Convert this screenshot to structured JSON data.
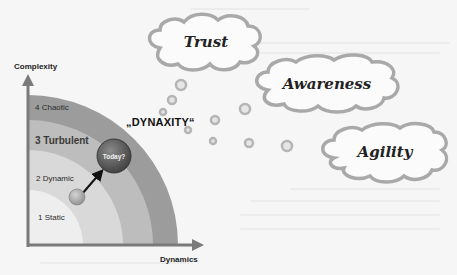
{
  "diagram": {
    "y_axis_label": "Complexity",
    "x_axis_label": "Dynamics",
    "title": "„DYNAXITY“",
    "zones": [
      {
        "label": "1 Static",
        "emphasis": false,
        "color": "#eeeeee"
      },
      {
        "label": "2 Dynamic",
        "emphasis": false,
        "color": "#d9d9d9"
      },
      {
        "label": "3 Turbulent",
        "emphasis": true,
        "color": "#bdbdbd"
      },
      {
        "label": "4 Chaotic",
        "emphasis": false,
        "color": "#9c9c9c"
      }
    ],
    "current_state": {
      "label": "Today?",
      "color": "#555555"
    },
    "origin_state": {
      "color": "#a8a8a8"
    },
    "clouds": [
      {
        "label": "Trust"
      },
      {
        "label": "Awareness"
      },
      {
        "label": "Agility"
      }
    ],
    "colors": {
      "background": "#f6f6f6",
      "axis": "#7a7a7a",
      "cloud_outline": "#a9a9a9",
      "bubble": "#b5b5b5"
    }
  }
}
